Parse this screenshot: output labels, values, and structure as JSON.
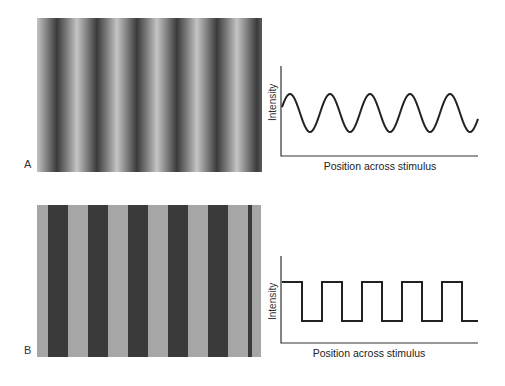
{
  "figure": {
    "panels": [
      {
        "label": "A",
        "stimulus": {
          "kind": "sine-wave grating",
          "cycles_visible": 5.6,
          "light_color": "#c4c4c4",
          "dark_color": "#3a3a3a"
        },
        "graph": {
          "ylabel": "Intensity",
          "xlabel": "Position across stimulus",
          "waveform": "sine",
          "cycles": 5
        }
      },
      {
        "label": "B",
        "stimulus": {
          "kind": "square-wave grating",
          "cycles_visible": 5.6,
          "light_color": "#a6a6a6",
          "dark_color": "#3a3a3a"
        },
        "graph": {
          "ylabel": "Intensity",
          "xlabel": "Position across stimulus",
          "waveform": "square",
          "cycles": 5
        }
      }
    ]
  },
  "chart_data": [
    {
      "type": "line",
      "title": "",
      "xlabel": "Position across stimulus",
      "ylabel": "Intensity",
      "series": [
        {
          "name": "sine grating profile",
          "function": "sine",
          "cycles": 5,
          "phase_start": "mid-rising"
        }
      ],
      "xlim": [
        0,
        5.5
      ],
      "ylim": [
        -2.2,
        2.5
      ],
      "grid": false
    },
    {
      "type": "line",
      "title": "",
      "xlabel": "Position across stimulus",
      "ylabel": "Intensity",
      "series": [
        {
          "name": "square grating profile",
          "function": "square",
          "cycles": 5,
          "phase_start": "high"
        }
      ],
      "xlim": [
        0,
        5.0
      ],
      "ylim": [
        -1.6,
        2.1
      ],
      "grid": false
    }
  ]
}
